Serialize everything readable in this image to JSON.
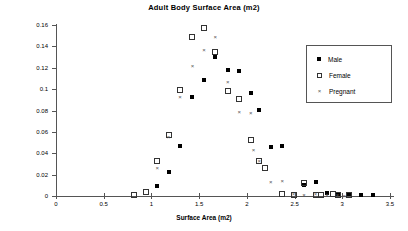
{
  "chart_data": {
    "type": "scatter",
    "title": "Adult Body Surface Area (m2)",
    "xlabel": "Surface Area (m2)",
    "ylabel": "Percent",
    "xlim": [
      0,
      3.5
    ],
    "ylim": [
      0,
      0.16
    ],
    "xticks": [
      "0",
      "0.5",
      "1",
      "1.5",
      "2",
      "2.5",
      "3",
      "3.5"
    ],
    "xtick_values": [
      0,
      0.5,
      1,
      1.5,
      2,
      2.5,
      3,
      3.5
    ],
    "yticks": [
      "0",
      "0.02",
      "0.04",
      "0.06",
      "0.08",
      "0.1",
      "0.12",
      "0.14",
      "0.16"
    ],
    "ytick_values": [
      0,
      0.02,
      0.04,
      0.06,
      0.08,
      0.1,
      0.12,
      0.14,
      0.16
    ],
    "grid": false,
    "legend_position": "upper right",
    "series": [
      {
        "name": "Male",
        "marker": "filled-square",
        "color": "#000000",
        "points": [
          [
            1.06,
            0.0097
          ],
          [
            1.18,
            0.0225
          ],
          [
            1.3,
            0.047
          ],
          [
            1.43,
            0.0925
          ],
          [
            1.55,
            0.1085
          ],
          [
            1.67,
            0.1305
          ],
          [
            1.8,
            0.1182
          ],
          [
            1.92,
            0.1172
          ],
          [
            2.04,
            0.0962
          ],
          [
            2.13,
            0.0805
          ],
          [
            2.25,
            0.046
          ],
          [
            2.37,
            0.047
          ],
          [
            2.6,
            0.01
          ],
          [
            2.72,
            0.0127
          ],
          [
            2.84,
            0.003
          ],
          [
            2.95,
            0.0022
          ],
          [
            3.07,
            0.0018
          ],
          [
            3.2,
            0.0005
          ],
          [
            3.32,
            0.0005
          ]
        ]
      },
      {
        "name": "Female",
        "marker": "open-square",
        "color": "#333333",
        "points": [
          [
            0.82,
            0.0005
          ],
          [
            0.94,
            0.0038
          ],
          [
            1.06,
            0.0325
          ],
          [
            1.18,
            0.0572
          ],
          [
            1.3,
            0.099
          ],
          [
            1.43,
            0.149
          ],
          [
            1.55,
            0.157
          ],
          [
            1.67,
            0.1345
          ],
          [
            1.8,
            0.0982
          ],
          [
            1.92,
            0.0907
          ],
          [
            2.04,
            0.0522
          ],
          [
            2.13,
            0.0332
          ],
          [
            2.19,
            0.026
          ],
          [
            2.37,
            0.0018
          ],
          [
            2.49,
            0.001
          ],
          [
            2.6,
            0.0125
          ],
          [
            2.72,
            0.0005
          ],
          [
            2.78,
            0.0008
          ],
          [
            2.9,
            0.0015
          ],
          [
            2.95,
            0.0005
          ],
          [
            3.07,
            0.0012
          ]
        ]
      },
      {
        "name": "Pregnant",
        "marker": "cross",
        "color": "#555555",
        "points": [
          [
            1.06,
            0.0265
          ],
          [
            1.18,
            0.055
          ],
          [
            1.3,
            0.0925
          ],
          [
            1.43,
            0.1215
          ],
          [
            1.55,
            0.137
          ],
          [
            1.67,
            0.149
          ],
          [
            1.8,
            0.1062
          ],
          [
            1.92,
            0.0782
          ],
          [
            2.04,
            0.0775
          ],
          [
            2.07,
            0.0432
          ],
          [
            2.13,
            0.0332
          ],
          [
            2.25,
            0.013
          ],
          [
            2.37,
            0.0138
          ],
          [
            2.49,
            0.0022
          ],
          [
            2.6,
            0.001
          ],
          [
            2.72,
            0.0022
          ],
          [
            2.84,
            0.0012
          ],
          [
            2.95,
            0.0005
          ],
          [
            3.02,
            0.0002
          ]
        ]
      }
    ]
  },
  "legend": {
    "items": [
      {
        "label": "Male",
        "marker": "filled-square"
      },
      {
        "label": "Female",
        "marker": "open-square"
      },
      {
        "label": "Pregnant",
        "marker": "cross"
      }
    ]
  }
}
